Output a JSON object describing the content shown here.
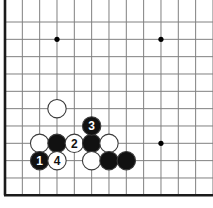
{
  "diagram": {
    "kind": "go-board-diagram",
    "board": {
      "background_color": "#ffffff",
      "grid_color": "#808080",
      "border_color": "#1a1a1a",
      "star_point_color": "#000000",
      "origin_x": 5,
      "origin_y": 22,
      "cell_size": 17.33,
      "cols": 13,
      "rows": 11,
      "left_edge_thick": true,
      "bottom_edge_thick": true,
      "top_edge_thick": false,
      "right_edge_thick": false,
      "border_width": 2.6,
      "grid_width": 1
    },
    "star_points": [
      {
        "col": 3,
        "row": 1
      },
      {
        "col": 9,
        "row": 1
      },
      {
        "col": 9,
        "row": 7
      }
    ],
    "stone_style": {
      "radius": 9.2,
      "black_fill": "#111111",
      "white_fill": "#ffffff",
      "outline_color": "#3a3a3a",
      "outline_width": 1.1,
      "label_font_size": 12,
      "black_label_color": "#ffffff",
      "white_label_color": "#111111"
    },
    "stones": [
      {
        "id": "white-a",
        "color": "white",
        "col": 3,
        "row": 5,
        "label": ""
      },
      {
        "id": "white-b",
        "color": "white",
        "col": 2,
        "row": 7,
        "label": ""
      },
      {
        "id": "black-a",
        "color": "black",
        "col": 3,
        "row": 7,
        "label": ""
      },
      {
        "id": "move-2",
        "color": "white",
        "col": 4,
        "row": 7,
        "label": "2"
      },
      {
        "id": "black-b",
        "color": "black",
        "col": 5,
        "row": 7,
        "label": ""
      },
      {
        "id": "white-c",
        "color": "white",
        "col": 6,
        "row": 7,
        "label": ""
      },
      {
        "id": "move-3",
        "color": "black",
        "col": 5,
        "row": 6,
        "label": "3"
      },
      {
        "id": "move-1",
        "color": "black",
        "col": 2,
        "row": 8,
        "label": "1"
      },
      {
        "id": "move-4",
        "color": "white",
        "col": 3,
        "row": 8,
        "label": "4"
      },
      {
        "id": "white-d",
        "color": "white",
        "col": 5,
        "row": 8,
        "label": ""
      },
      {
        "id": "black-c",
        "color": "black",
        "col": 6,
        "row": 8,
        "label": ""
      },
      {
        "id": "black-d",
        "color": "black",
        "col": 7,
        "row": 8,
        "label": ""
      }
    ],
    "move_sequence": [
      {
        "number": "1",
        "color": "black"
      },
      {
        "number": "2",
        "color": "white"
      },
      {
        "number": "3",
        "color": "black"
      },
      {
        "number": "4",
        "color": "white"
      }
    ]
  }
}
